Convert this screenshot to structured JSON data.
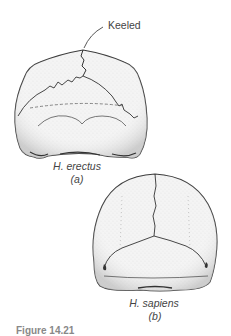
{
  "figure": {
    "annotation": "Keeled",
    "panels": [
      {
        "id": "a",
        "species": "H. erectus",
        "letter": "(a)"
      },
      {
        "id": "b",
        "species": "H. sapiens",
        "letter": "(b)"
      }
    ],
    "caption_partial": "Figure 14.21"
  },
  "colors": {
    "ink": "#3a3a3a",
    "stipple": "#8a8a8a",
    "background": "#ffffff"
  }
}
